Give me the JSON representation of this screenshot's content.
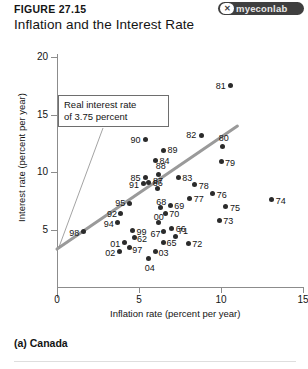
{
  "header": {
    "figure_number": "FIGURE 27.15",
    "title": "Inflation and the Interest Rate",
    "logo_text": "myeconlab",
    "logo_mark": "✕"
  },
  "caption": "(a) Canada",
  "annotation": {
    "line1": "Real interest rate",
    "line2": "of 3.75 percent",
    "full_text": "Real interest rate of 3.75 percent",
    "value": 3.75
  },
  "colors": {
    "dot": "#2b2b2b",
    "axis": "#8c8c8c",
    "trend_line": "#9a9a9a",
    "leader_line": "#8c8c8c",
    "text": "#141414",
    "logo_badge": "#3f3f3f"
  },
  "chart_data": {
    "type": "scatter",
    "title": "Inflation and the Interest Rate",
    "subtitle": "(a) Canada",
    "xlabel": "Inflation rate (percent per year)",
    "ylabel": "Interest rate (percent per year)",
    "xlim": [
      0,
      15
    ],
    "ylim": [
      0,
      20
    ],
    "xticks": [
      0,
      5,
      10,
      15
    ],
    "yticks": [
      5,
      10,
      15,
      20
    ],
    "grid": false,
    "legend": false,
    "point_label_field": "year",
    "points": [
      {
        "year": "81",
        "x": 10.6,
        "y": 17.5,
        "lx": -15,
        "ly": -4
      },
      {
        "year": "82",
        "x": 8.8,
        "y": 13.2,
        "lx": -15,
        "ly": -4
      },
      {
        "year": "80",
        "x": 10.1,
        "y": 12.2,
        "lx": -4,
        "ly": -13
      },
      {
        "year": "90",
        "x": 5.4,
        "y": 12.8,
        "lx": -15,
        "ly": -4
      },
      {
        "year": "89",
        "x": 6.5,
        "y": 11.9,
        "lx": 4,
        "ly": -4
      },
      {
        "year": "79",
        "x": 10.0,
        "y": 10.9,
        "lx": 4,
        "ly": -3
      },
      {
        "year": "84",
        "x": 6.0,
        "y": 11.0,
        "lx": 4,
        "ly": -4
      },
      {
        "year": "88",
        "x": 6.2,
        "y": 9.8,
        "lx": -3,
        "ly": -12
      },
      {
        "year": "83",
        "x": 7.4,
        "y": 9.5,
        "lx": 4,
        "ly": -4
      },
      {
        "year": "85",
        "x": 5.4,
        "y": 9.5,
        "lx": -15,
        "ly": -4
      },
      {
        "year": "86",
        "x": 5.6,
        "y": 9.1,
        "lx": 4,
        "ly": -3
      },
      {
        "year": "91",
        "x": 5.3,
        "y": 9.0,
        "lx": -15,
        "ly": -3
      },
      {
        "year": "87",
        "x": 6.1,
        "y": 8.6,
        "lx": -4,
        "ly": -11
      },
      {
        "year": "78",
        "x": 8.4,
        "y": 8.9,
        "lx": 4,
        "ly": -3
      },
      {
        "year": "76",
        "x": 9.5,
        "y": 8.1,
        "lx": 4,
        "ly": -3
      },
      {
        "year": "77",
        "x": 8.1,
        "y": 7.7,
        "lx": 4,
        "ly": -3
      },
      {
        "year": "74",
        "x": 13.1,
        "y": 7.6,
        "lx": 4,
        "ly": -3
      },
      {
        "year": "95",
        "x": 4.4,
        "y": 7.3,
        "lx": -14,
        "ly": -4
      },
      {
        "year": "69",
        "x": 6.9,
        "y": 7.1,
        "lx": 4,
        "ly": -3
      },
      {
        "year": "68",
        "x": 6.3,
        "y": 6.9,
        "lx": -4,
        "ly": -10
      },
      {
        "year": "75",
        "x": 10.3,
        "y": 7.0,
        "lx": 4,
        "ly": -3
      },
      {
        "year": "92",
        "x": 3.9,
        "y": 6.4,
        "lx": -14,
        "ly": -3
      },
      {
        "year": "70",
        "x": 6.6,
        "y": 6.4,
        "lx": 4,
        "ly": -3
      },
      {
        "year": "94",
        "x": 3.7,
        "y": 5.6,
        "lx": -14,
        "ly": -3
      },
      {
        "year": "00",
        "x": 6.2,
        "y": 5.6,
        "lx": -5,
        "ly": -10
      },
      {
        "year": "73",
        "x": 9.9,
        "y": 5.8,
        "lx": 4,
        "ly": -3
      },
      {
        "year": "66",
        "x": 7.0,
        "y": 5.1,
        "lx": 4,
        "ly": -3
      },
      {
        "year": "67",
        "x": 6.5,
        "y": 4.8,
        "lx": -13,
        "ly": -2
      },
      {
        "year": "99",
        "x": 4.6,
        "y": 4.9,
        "lx": 4,
        "ly": -3
      },
      {
        "year": "98",
        "x": 1.6,
        "y": 4.8,
        "lx": -14,
        "ly": -3
      },
      {
        "year": "71",
        "x": 7.2,
        "y": 4.4,
        "lx": 3,
        "ly": -9
      },
      {
        "year": "62",
        "x": 4.7,
        "y": 4.3,
        "lx": 3,
        "ly": -3
      },
      {
        "year": "65",
        "x": 6.5,
        "y": 3.9,
        "lx": 3,
        "ly": -3
      },
      {
        "year": "72",
        "x": 8.0,
        "y": 3.8,
        "lx": 4,
        "ly": -3
      },
      {
        "year": "01",
        "x": 4.1,
        "y": 3.9,
        "lx": -14,
        "ly": -2
      },
      {
        "year": "97",
        "x": 4.4,
        "y": 3.4,
        "lx": 3,
        "ly": -2
      },
      {
        "year": "02",
        "x": 3.8,
        "y": 3.1,
        "lx": -14,
        "ly": -2
      },
      {
        "year": "03",
        "x": 6.0,
        "y": 3.1,
        "lx": 3,
        "ly": -2
      },
      {
        "year": "04",
        "x": 5.6,
        "y": 2.5,
        "lx": -4,
        "ly": 6
      }
    ],
    "trend_line": {
      "description": "real interest rate reference line, slope 1",
      "x0": 0.0,
      "y0": 3.3,
      "x1": 11.0,
      "y1": 14.0
    }
  }
}
